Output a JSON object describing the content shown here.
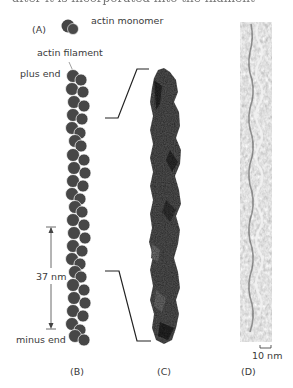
{
  "header": {
    "partial_text": "after it is incorporated into the filament"
  },
  "panel_a": {
    "label": "(A)",
    "legend_text": "actin monomer",
    "monomer_color": "#454545"
  },
  "panel_b": {
    "label": "(B)",
    "filament_label": "actin filament",
    "plus_end_label": "plus end",
    "minus_end_label": "minus end",
    "repeat_label": "37 nm",
    "monomer_color": "#474747"
  },
  "panel_c": {
    "label": "(C)",
    "description": "atomic model of actin filament"
  },
  "panel_d": {
    "label": "(D)",
    "scale_bar_label": "10 nm",
    "description": "electron micrograph of actin filament"
  }
}
